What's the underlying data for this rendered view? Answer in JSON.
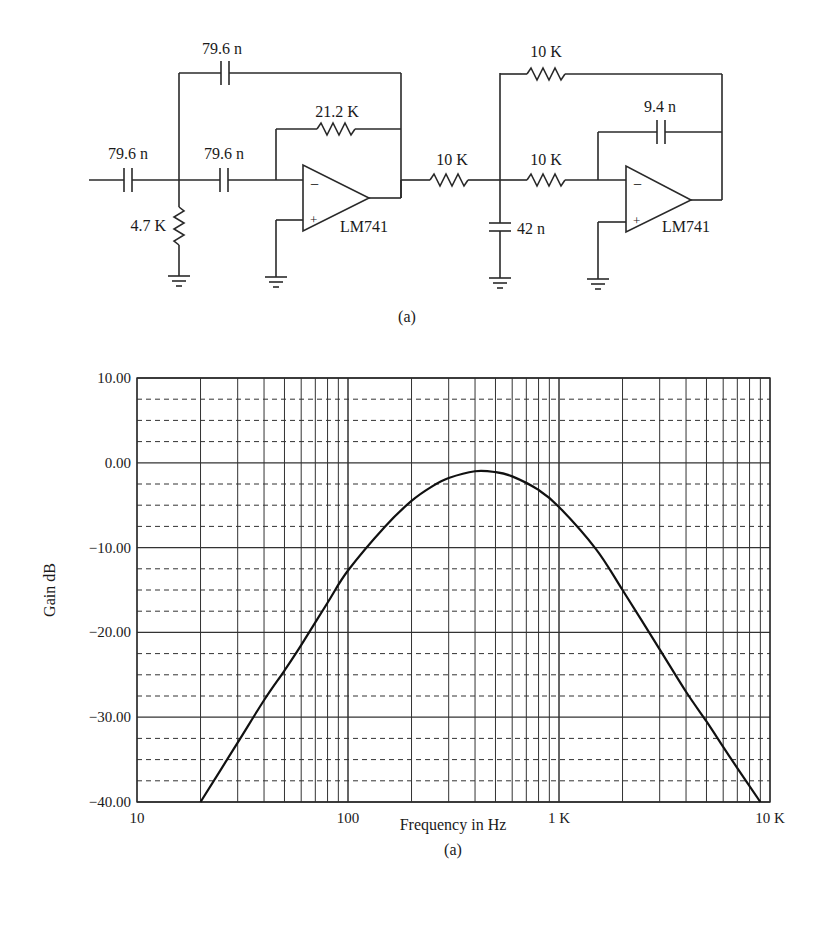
{
  "circuit": {
    "caption": "(a)",
    "stage1": {
      "input_cap": "79.6 n",
      "series_cap": "79.6 n",
      "feedback_cap": "79.6 n",
      "feedback_res": "21.2 K",
      "shunt_res": "4.7 K",
      "opamp": "LM741"
    },
    "coupling_res": "10 K",
    "stage2": {
      "shunt_cap": "42 n",
      "input_res": "10 K",
      "feedback_res": "10 K",
      "feedback_cap": "9.4 n",
      "opamp": "LM741"
    },
    "minus_sign": "−",
    "plus_sign": "+"
  },
  "chart_data": {
    "type": "line",
    "title": "",
    "caption": "(a)",
    "xlabel": "Frequency in Hz",
    "ylabel": "Gain dB",
    "xscale": "log",
    "xlim": [
      10,
      10000
    ],
    "ylim": [
      -40,
      10
    ],
    "x_tick_labels": [
      "10",
      "100",
      "1 K",
      "10 K"
    ],
    "y_tick_labels": [
      "10.00",
      "0.00",
      "−10.00",
      "−20.00",
      "−30.00",
      "−40.00"
    ],
    "grid": {
      "major_y": "solid every 10 dB",
      "minor_y": "dashed every 2.5 dB",
      "x": "solid log decades with 2..9 subdivisions"
    },
    "series": [
      {
        "name": "Gain",
        "x": [
          20,
          30,
          40,
          50,
          60,
          80,
          100,
          150,
          200,
          250,
          300,
          400,
          500,
          600,
          800,
          1000,
          1500,
          2000,
          3000,
          4000,
          5000,
          6000,
          7000,
          9000
        ],
        "y": [
          -40,
          -33,
          -28,
          -24.5,
          -21.5,
          -16.5,
          -12.7,
          -7.5,
          -4.5,
          -2.8,
          -1.8,
          -1.0,
          -1.1,
          -1.6,
          -3.2,
          -5.2,
          -10.2,
          -15,
          -22,
          -27,
          -30.5,
          -33.5,
          -36,
          -40
        ]
      }
    ]
  }
}
